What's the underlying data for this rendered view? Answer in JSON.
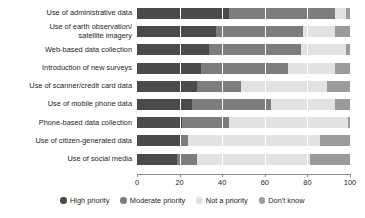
{
  "chart_data": {
    "type": "bar",
    "orientation": "horizontal",
    "stacked": true,
    "title": "",
    "subtitle": "",
    "xlabel": "",
    "ylabel": "",
    "xlim": [
      0,
      100
    ],
    "xticks": [
      0,
      20,
      40,
      60,
      80,
      100
    ],
    "xtick_labels": [
      "0",
      "20",
      "40",
      "60",
      "80",
      "100"
    ],
    "grid": false,
    "legend_position": "bottom",
    "categories": [
      "Use of administrative data",
      "Use of earth observation/ satellite imagery",
      "Web-based data collection",
      "Introduction of new surveys",
      "Use of scanner/credit card data",
      "Use of mobile phone data",
      "Phone-based data collection",
      "Use of citizen-generated data",
      "Use of social media"
    ],
    "category_lines": [
      [
        "Use of administrative data"
      ],
      [
        "Use of earth observation/",
        "satellite imagery"
      ],
      [
        "Web-based data collection"
      ],
      [
        "Introduction of new surveys"
      ],
      [
        "Use of scanner/credit card data"
      ],
      [
        "Use of mobile phone data"
      ],
      [
        "Phone-based data collection"
      ],
      [
        "Use of citizen-generated data"
      ],
      [
        "Use of social media"
      ]
    ],
    "series": [
      {
        "name": "High priority",
        "color": "#4b4b4b",
        "values": [
          43,
          37,
          34,
          30,
          28,
          26,
          21,
          20,
          19
        ]
      },
      {
        "name": "Moderate priority",
        "color": "#7d7d7d",
        "values": [
          50,
          41,
          43,
          41,
          21,
          37,
          22,
          4,
          9
        ]
      },
      {
        "name": "Not a priority",
        "color": "#e2e2e2",
        "values": [
          5,
          15,
          21,
          22,
          40,
          30,
          56,
          62,
          53
        ]
      },
      {
        "name": "Don't know",
        "color": "#9b9b9b",
        "values": [
          2,
          7,
          2,
          7,
          11,
          7,
          1,
          14,
          19
        ]
      }
    ],
    "legend": [
      {
        "label": "High priority",
        "color": "#4b4b4b"
      },
      {
        "label": "Moderate priority",
        "color": "#7d7d7d"
      },
      {
        "label": "Not a priority",
        "color": "#e2e2e2"
      },
      {
        "label": "Don't know",
        "color": "#9b9b9b"
      }
    ]
  }
}
